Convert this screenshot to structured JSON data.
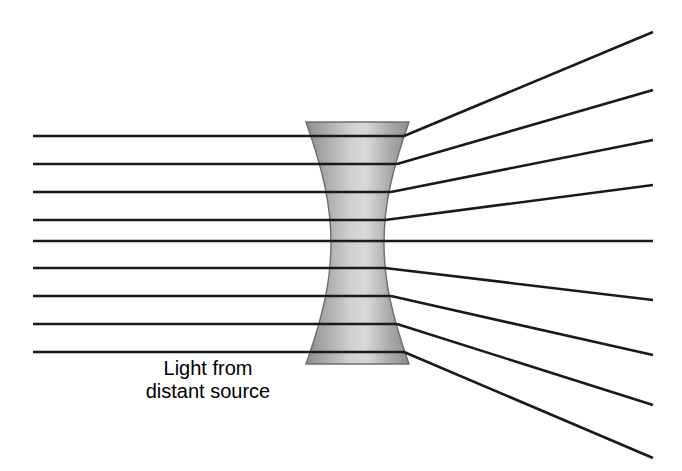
{
  "figure": {
    "background_color": "#ffffff",
    "width": 682,
    "height": 471
  },
  "caption": {
    "line1": "Light from",
    "line2": "distant source",
    "x": 208,
    "y1": 375,
    "y2": 398,
    "font_size": 20,
    "color": "#000000"
  },
  "lens": {
    "name": "biconcave-diverging-lens",
    "type": "concave",
    "top_y": 122,
    "bottom_y": 364,
    "top_left_x": 306,
    "top_right_x": 409,
    "bottom_left_x": 306,
    "bottom_right_x": 409,
    "waist_left_x": 331,
    "waist_right_x": 384,
    "waist_y": 243,
    "edge_color": "#6e6e6e",
    "gradient_edge_color": "#8e8e8e",
    "gradient_center_color": "#d9d9d9",
    "path": "M 306,122 L 409,122 C 392,170 384,205 384,243 C 384,281 392,316 409,364 L 306,364 C 323,316 331,281 331,243 C 331,205 323,170 306,122 Z"
  },
  "chart_data": {
    "type": "diagram",
    "optical_axis_y": 241,
    "ray_color": "#1a1a1a",
    "ray_width": 2.6,
    "incoming_start_x": 33,
    "exit_end_x": 653,
    "ray_count": 9,
    "rays": [
      {
        "id": "ray-1",
        "incoming_y": 136,
        "enter_x": 33,
        "lens_in_x": 310,
        "lens_out_x": 404,
        "exit_y": 32
      },
      {
        "id": "ray-2",
        "incoming_y": 164,
        "enter_x": 33,
        "lens_in_x": 317,
        "lens_out_x": 397,
        "exit_y": 90
      },
      {
        "id": "ray-3",
        "incoming_y": 192,
        "enter_x": 33,
        "lens_in_x": 324,
        "lens_out_x": 391,
        "exit_y": 140
      },
      {
        "id": "ray-4",
        "incoming_y": 220,
        "enter_x": 33,
        "lens_in_x": 329,
        "lens_out_x": 385,
        "exit_y": 185
      },
      {
        "id": "ray-5",
        "incoming_y": 241,
        "enter_x": 33,
        "lens_in_x": 331,
        "lens_out_x": 384,
        "exit_y": 241
      },
      {
        "id": "ray-6",
        "incoming_y": 268,
        "enter_x": 33,
        "lens_in_x": 329,
        "lens_out_x": 385,
        "exit_y": 300
      },
      {
        "id": "ray-7",
        "incoming_y": 296,
        "enter_x": 33,
        "lens_in_x": 324,
        "lens_out_x": 391,
        "exit_y": 355
      },
      {
        "id": "ray-8",
        "incoming_y": 324,
        "enter_x": 33,
        "lens_in_x": 317,
        "lens_out_x": 397,
        "exit_y": 405
      },
      {
        "id": "ray-9",
        "incoming_y": 352,
        "enter_x": 33,
        "lens_in_x": 310,
        "lens_out_x": 404,
        "exit_y": 458
      }
    ],
    "annotations": [
      {
        "text": "Light from",
        "x": 208,
        "y": 375
      },
      {
        "text": "distant source",
        "x": 208,
        "y": 398
      }
    ]
  }
}
